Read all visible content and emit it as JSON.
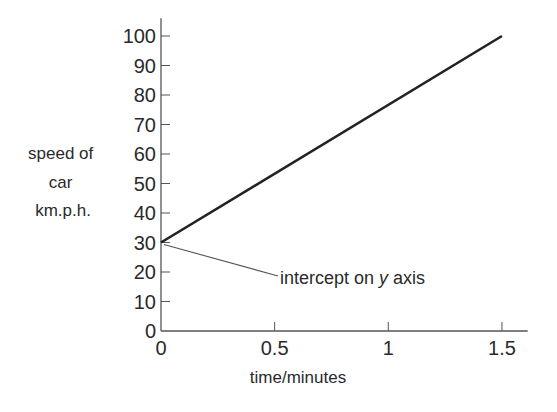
{
  "chart_data": {
    "type": "line",
    "title": "",
    "xlabel": "time/minutes",
    "ylabel_lines": [
      "speed of",
      "car",
      "km.p.h."
    ],
    "xlim": [
      0,
      1.6
    ],
    "ylim": [
      0,
      105
    ],
    "x_ticks": [
      0,
      0.5,
      1,
      1.5
    ],
    "x_tick_labels": [
      "0",
      "0.5",
      "1",
      "1.5"
    ],
    "y_ticks": [
      0,
      10,
      20,
      30,
      40,
      50,
      60,
      70,
      80,
      90,
      100
    ],
    "y_tick_labels": [
      "0",
      "10",
      "20",
      "30",
      "40",
      "50",
      "60",
      "70",
      "80",
      "90",
      "100"
    ],
    "grid": false,
    "series": [
      {
        "name": "speed",
        "x": [
          0,
          1.5
        ],
        "y": [
          30,
          100
        ],
        "color": "#222222"
      }
    ],
    "annotations": [
      {
        "text_prefix": "intercept on ",
        "text_italic": "y",
        "text_suffix": " axis",
        "target": [
          0,
          30
        ]
      }
    ]
  }
}
